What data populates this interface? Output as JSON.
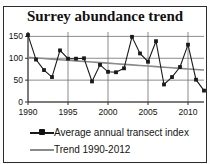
{
  "figure": {
    "title": "Surrey abundance trend"
  },
  "legend": {
    "items": [
      {
        "label": "Average annual transect index",
        "key": "line-with-marker",
        "color": "#1a1a1a"
      },
      {
        "label": "Trend 1990-2012",
        "key": "plain-line",
        "color": "#8a8a8a"
      }
    ]
  },
  "axes": {
    "y_ticks": [
      "0",
      "50",
      "100",
      "150"
    ],
    "x_ticks": [
      "1990",
      "1995",
      "2000",
      "2005",
      "2010"
    ]
  },
  "chart_data": {
    "type": "line",
    "title": "Surrey abundance trend",
    "xlabel": "",
    "ylabel": "",
    "xlim": [
      1990,
      2012
    ],
    "ylim": [
      0,
      160
    ],
    "grid": true,
    "legend_position": "bottom",
    "x": [
      1990,
      1991,
      1992,
      1993,
      1994,
      1995,
      1996,
      1997,
      1998,
      1999,
      2000,
      2001,
      2002,
      2003,
      2004,
      2005,
      2006,
      2007,
      2008,
      2009,
      2010,
      2011,
      2012
    ],
    "series": [
      {
        "name": "Average annual transect index",
        "color": "#1a1a1a",
        "marker": "square",
        "values": [
          153,
          97,
          73,
          57,
          118,
          99,
          99,
          100,
          47,
          85,
          69,
          68,
          77,
          149,
          111,
          92,
          139,
          40,
          57,
          80,
          131,
          51,
          26
        ]
      },
      {
        "name": "Trend 1990-2012",
        "color": "#8a8a8a",
        "marker": "none",
        "values": [
          102,
          100.7,
          99.4,
          98.0,
          96.7,
          95.4,
          94.1,
          92.7,
          91.4,
          90.1,
          88.8,
          87.5,
          86.1,
          84.8,
          83.5,
          82.2,
          80.8,
          79.5,
          78.2,
          76.9,
          75.5,
          74.2,
          73
        ]
      }
    ],
    "y_ticks": [
      0,
      50,
      100,
      150
    ],
    "x_ticks": [
      1990,
      1995,
      2000,
      2005,
      2010
    ]
  }
}
